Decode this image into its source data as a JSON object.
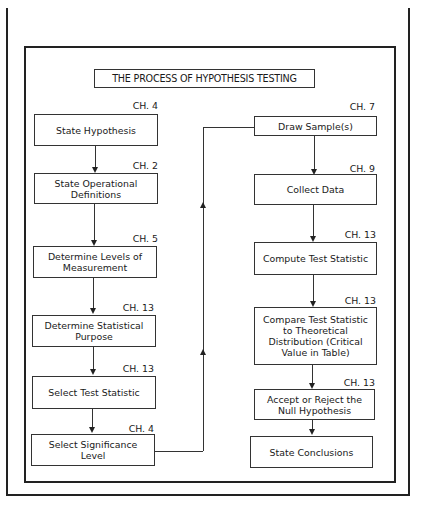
{
  "diagram": {
    "title": "THE PROCESS OF HYPOTHESIS TESTING",
    "left_column": [
      {
        "chapter": "CH. 4",
        "label": "State Hypothesis"
      },
      {
        "chapter": "CH. 2",
        "label": "State Operational Definitions"
      },
      {
        "chapter": "CH. 5",
        "label": "Determine Levels of Measurement"
      },
      {
        "chapter": "CH. 13",
        "label": "Determine Statistical Purpose"
      },
      {
        "chapter": "CH. 13",
        "label": "Select Test Statistic"
      },
      {
        "chapter": "CH. 4",
        "label": "Select Significance Level"
      }
    ],
    "right_column": [
      {
        "chapter": "CH. 7",
        "label": "Draw Sample(s)"
      },
      {
        "chapter": "CH. 9",
        "label": "Collect Data"
      },
      {
        "chapter": "CH. 13",
        "label": "Compute Test Statistic"
      },
      {
        "chapter": "CH. 13",
        "label": "Compare Test Statistic to Theoretical Distribution (Critical Value in Table)"
      },
      {
        "chapter": "CH. 13",
        "label": "Accept or Reject the Null Hypothesis"
      },
      {
        "chapter": "",
        "label": "State Conclusions"
      }
    ]
  }
}
